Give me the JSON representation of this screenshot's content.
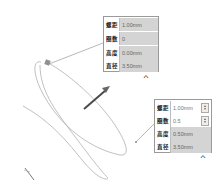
{
  "panel_top": {
    "rows": [
      {
        "label": "螺距",
        "value": "1.00mm"
      },
      {
        "label": "圈数",
        "value": "0"
      },
      {
        "label": "高度",
        "value": "0.00mm"
      },
      {
        "label": "直径",
        "value": "3.50mm"
      }
    ],
    "collapse_icon": "chevron-up"
  },
  "panel_bottom": {
    "rows": [
      {
        "label": "螺距",
        "value": "1.00mm"
      },
      {
        "label": "圈数",
        "value": "0.5"
      },
      {
        "label": "高度",
        "value": "0.50mm"
      },
      {
        "label": "直径",
        "value": "3.50mm"
      }
    ],
    "collapse_icon": "chevron-up"
  },
  "colors": {
    "curve": "#999999",
    "arrow": "#555555",
    "panel_border": "#9a9a9a",
    "readonly_bg": "#d4d4d4"
  }
}
